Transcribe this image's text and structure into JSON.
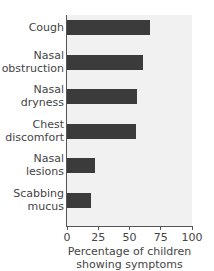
{
  "chart_data": {
    "type": "bar",
    "orientation": "horizontal",
    "title": "",
    "categories": [
      "Cough",
      "Nasal obstruction",
      "Nasal dryness",
      "Chest discomfort",
      "Nasal lesions",
      "Scabbing mucus"
    ],
    "category_labels": [
      "Cough",
      "Nasal\nobstruction",
      "Nasal\ndryness",
      "Chest\ndiscomfort",
      "Nasal\nlesions",
      "Scabbing\nmucus"
    ],
    "values": [
      66,
      61,
      56,
      55,
      22,
      19
    ],
    "xlabel": "Percentage of children showing symptoms",
    "xlabel_lines": [
      "Percentage of children",
      "showing symptoms"
    ],
    "ylabel": "",
    "xlim": [
      0,
      100
    ],
    "xticks": [
      "0",
      "25",
      "50",
      "75",
      "100"
    ],
    "grid": false,
    "legend": null,
    "bar_color": "#3b3b3b",
    "background_color": "#f1f1f1"
  }
}
